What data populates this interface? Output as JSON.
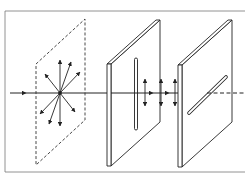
{
  "caption": {
    "visible_text": "",
    "note": "clipped text line at top edge, illegible"
  },
  "diagram": {
    "type": "polarization-of-light",
    "elements": [
      {
        "id": "unpolarized-light-plane",
        "style": "dashed",
        "vectors": 8
      },
      {
        "id": "polarizer-plate",
        "slit": "vertical"
      },
      {
        "id": "polarized-light",
        "vectors": 3,
        "orientation": "vertical"
      },
      {
        "id": "analyzer-plate",
        "slit": "diagonal"
      },
      {
        "id": "blocked-light",
        "style": "dashed"
      }
    ],
    "colors": {
      "line": "#222222",
      "background": "#ffffff"
    }
  }
}
